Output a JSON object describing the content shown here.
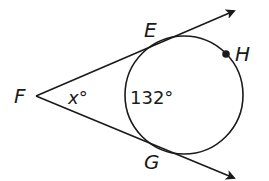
{
  "diagram": {
    "type": "geometry-tangents-circle",
    "stroke_color": "#1a1a1a",
    "labels": {
      "vertex": "F",
      "tangent_point_top": "E",
      "tangent_point_bottom": "G",
      "arc_point": "H",
      "angle": "x°",
      "arc_measure": "132°"
    },
    "circle": {
      "cx": 184,
      "cy": 95,
      "r": 59
    },
    "vertex_point": {
      "x": 36,
      "y": 96
    }
  }
}
